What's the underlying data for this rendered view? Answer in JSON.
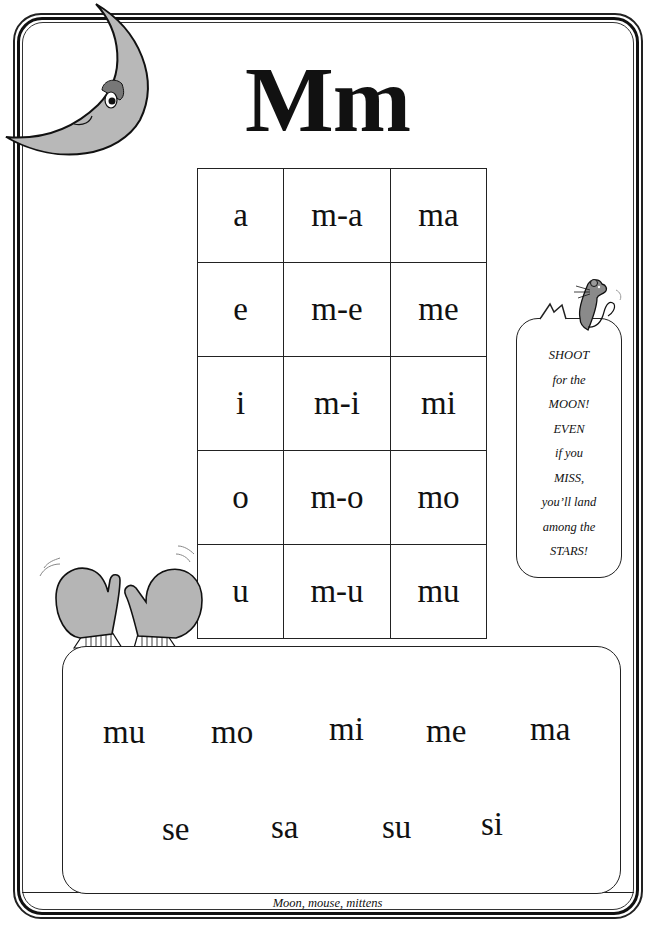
{
  "title": "Mm",
  "syllable_table": {
    "rows": [
      {
        "vowel": "a",
        "blend": "m-a",
        "syllable": "ma"
      },
      {
        "vowel": "e",
        "blend": "m-e",
        "syllable": "me"
      },
      {
        "vowel": "i",
        "blend": "m-i",
        "syllable": "mi"
      },
      {
        "vowel": "o",
        "blend": "m-o",
        "syllable": "mo"
      },
      {
        "vowel": "u",
        "blend": "m-u",
        "syllable": "mu"
      }
    ]
  },
  "speech_bubble": {
    "lines": [
      "SHOOT",
      "for the",
      "MOON!",
      "EVEN",
      "if you",
      "MISS,",
      "you’ll land",
      "among the",
      "STARS!"
    ]
  },
  "practice_words": {
    "row1": [
      "mu",
      "mo",
      "mi",
      "me",
      "ma"
    ],
    "row2": [
      "se",
      "sa",
      "su",
      "si"
    ]
  },
  "caption": "Moon, mouse, mittens",
  "illustrations": {
    "top_left": "crescent-moon-face",
    "right": "mouse",
    "bottom_left": "mittens"
  },
  "colors": {
    "ink": "#111111",
    "fill_gray": "#b5b5b5",
    "background": "#ffffff"
  }
}
